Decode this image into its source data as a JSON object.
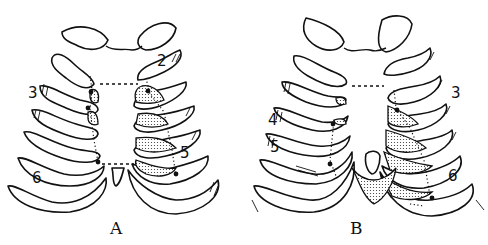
{
  "figure": {
    "type": "anatomical line drawing",
    "colors": {
      "ink": "#111111",
      "background": "#ffffff"
    },
    "panels": [
      {
        "id": "A",
        "caption": "A",
        "rib_labels": [
          {
            "text": "2",
            "side": "right"
          },
          {
            "text": "3",
            "side": "left"
          },
          {
            "text": "5",
            "side": "right"
          },
          {
            "text": "6",
            "side": "left"
          }
        ]
      },
      {
        "id": "B",
        "caption": "B",
        "rib_labels": [
          {
            "text": "3",
            "side": "right"
          },
          {
            "text": "4",
            "side": "left"
          },
          {
            "text": "5",
            "side": "left"
          },
          {
            "text": "6",
            "side": "right"
          }
        ]
      }
    ]
  }
}
